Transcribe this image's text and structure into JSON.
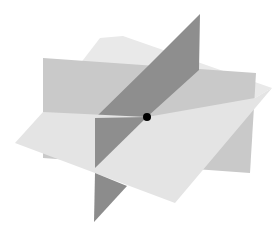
{
  "diagram": {
    "colors": {
      "background": "#ffffff",
      "horizontal_plane": "#e6e6e6",
      "vertical_plane_back": "#c8c8c8",
      "vertical_plane_dark": "#8c8c8c",
      "intersection_point": "#000000"
    },
    "intersection_point": {
      "cx": 147,
      "cy": 117,
      "r": 4
    }
  }
}
